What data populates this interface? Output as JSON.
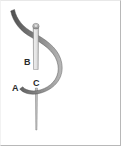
{
  "figure": {
    "background_color": "#ffffff",
    "frame_color": "#b8b8b8",
    "labels": [
      {
        "id": "A",
        "text": "A",
        "target": "hook-tip",
        "x": 12,
        "y": 84
      },
      {
        "id": "B",
        "text": "B",
        "target": "upper-shaft",
        "x": 24,
        "y": 58
      },
      {
        "id": "C",
        "text": "C",
        "target": "shaft-hook-junction",
        "x": 33,
        "y": 79
      }
    ],
    "parts": {
      "curve_name": "curved-hook",
      "curve_color_dark": "#5e5e5e",
      "curve_color_mid": "#8c8c8c",
      "curve_color_light": "#c9c9c9",
      "shaft_name": "straight-shaft",
      "shaft_color_light": "#e3e3e3",
      "shaft_color_edge": "#9a9a9a",
      "knob_name": "shaft-top-knob",
      "knob_color": "#a8a8a8"
    }
  }
}
